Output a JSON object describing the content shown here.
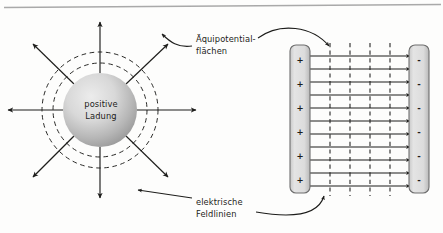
{
  "figure": {
    "title_text": "",
    "background_color": "#fdfdfc",
    "ink_color": "#1d1d1b",
    "rule_color": "#a9a9a9"
  },
  "labels": {
    "sphere_line1": "positive",
    "sphere_line2": "Ladung",
    "equipotential_line1": "Äquipotential-",
    "equipotential_line2": "flächen",
    "fieldlines_line1": "elektrische",
    "fieldlines_line2": "Feldlinien"
  },
  "point_charge": {
    "name": "positive point charge",
    "sphere_fill_light": "#e6e6e6",
    "sphere_fill_dark": "#9d9d9d",
    "center_x": 100,
    "center_y": 110,
    "radius": 37,
    "equipotential_circle_radii": [
      47,
      58
    ],
    "radial_arrow_count": 8,
    "radial_arrow_angles_deg": [
      0,
      45,
      90,
      135,
      180,
      225,
      270,
      315
    ],
    "arrow_tip_radius": 88
  },
  "capacitor": {
    "name": "parallel plate capacitor",
    "plate_fill_light": "#e2e2e2",
    "plate_fill_dark": "#b4b4b4",
    "plate_stroke": "#6e6e6e",
    "positive_plate": {
      "label": "+",
      "sign_count": 6,
      "x": 290,
      "y": 45,
      "width": 20,
      "height": 148
    },
    "negative_plate": {
      "label": "-",
      "sign_count": 6,
      "x": 409,
      "y": 45,
      "width": 20,
      "height": 148
    },
    "field_lines": {
      "count": 11,
      "direction": "left-to-right",
      "start_x": 310,
      "end_x": 409,
      "top_y": 55,
      "bottom_y": 185
    },
    "equipotential_lines": {
      "count": 4,
      "style": "dashed-vertical",
      "x_positions": [
        330,
        350,
        370,
        390
      ],
      "top_y": 43,
      "bottom_y": 196
    }
  },
  "annotations": [
    {
      "name": "equipotential-annotation",
      "text_x": 196,
      "text_y": 41,
      "points_to": [
        "dashed circles around sphere",
        "dashed vertical lines in capacitor"
      ]
    },
    {
      "name": "fieldlines-annotation",
      "text_x": 196,
      "text_y": 205,
      "points_to": [
        "radial arrow below sphere",
        "horizontal field lines in capacitor"
      ]
    }
  ]
}
